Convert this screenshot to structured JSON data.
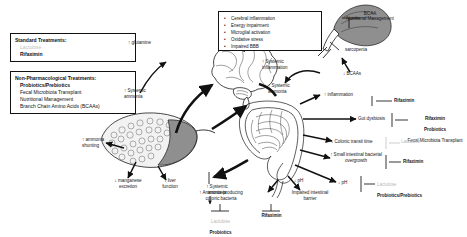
{
  "treatment_boxes": [
    {
      "id": "standard-treatments",
      "header": "Standard Treatments:",
      "items": [
        {
          "text": "Lactulose",
          "style": "grey"
        },
        {
          "text": "Rifaximin",
          "style": "bold"
        }
      ]
    },
    {
      "id": "non-pharmacological-treatments",
      "header": "Non-Pharmacological Treatments:",
      "items": [
        {
          "text": "Probiotics/Prebiotics",
          "style": "bold"
        },
        {
          "text": "Fecal Microbiota Transplant",
          "style": "plain"
        },
        {
          "text": "Nutritional Management",
          "style": "plain"
        },
        {
          "text": "Branch Chain Amino Acids (BCAAs)",
          "style": "plain"
        }
      ]
    }
  ],
  "symptom_box": {
    "items": [
      "Cerebral inflammation",
      "Energy impairment",
      "Microglial activation",
      "Oxidative stress",
      "Impaired BBB"
    ]
  },
  "labels": {
    "glutamine": "↑ glutamine",
    "systemic_ammonia_left": "↑ Systemic\nammonia",
    "systemic_inflammation": "↑ Systemic\ninflammation",
    "systemic_ammonia_mid": "↑ Systemic\nammonia",
    "bcaa_management": "BCAA\nNutritional Management",
    "sarcopenia": "sarcopenia",
    "bcaas_down": "↓ BCAAs",
    "inflammation_up": "↑ inflammation",
    "gut_dysbiosis": "Gut dysbiosis",
    "colonic_transit": "↓ Colonic transit time",
    "sibo": "↑ Small intestinal bacterial\novergrowth",
    "ph_right": "↓ pH",
    "ph_center": "↓ pH",
    "ammonia_producing": "↑ Ammonia-producing\ncolonic bacteria",
    "impaired_barrier": "Impaired intestinal\nbarrier",
    "ammonia_shunting": "↑ ammonia\nshunting",
    "manganese": "↓ manganese\nexcretion",
    "liver_function": "↓ liver\nfunction",
    "systemic_ammonia_liver": "↑ Systemic\nammonia"
  },
  "treatment_annotations": {
    "inflammation_rx": {
      "lines": [
        {
          "text": "Rifaximin",
          "style": "bold"
        }
      ]
    },
    "dysbiosis_rx": {
      "lines": [
        {
          "text": "Rifaximin",
          "style": "bold"
        },
        {
          "text": "Probiotics",
          "style": "bold"
        },
        {
          "text": "Fecal Microbiota Transplant",
          "style": "plain"
        }
      ]
    },
    "transit_rx": {
      "lines": [
        {
          "text": "Lactulose",
          "style": "grey"
        }
      ]
    },
    "sibo_rx": {
      "lines": [
        {
          "text": "Rifaximin",
          "style": "bold"
        }
      ]
    },
    "ph_rx": {
      "lines": [
        {
          "text": "Lactulose",
          "style": "grey"
        },
        {
          "text": "Probiotics/Prebiotics",
          "style": "bold"
        }
      ]
    },
    "bacteria_rx": {
      "lines": [
        {
          "text": "Lactulose",
          "style": "grey"
        },
        {
          "text": "Probiotics",
          "style": "bold"
        }
      ]
    },
    "barrier_rx": {
      "lines": [
        {
          "text": "Rifaximin",
          "style": "bold"
        }
      ]
    }
  },
  "organs": {
    "brain": "brain",
    "liver": "liver",
    "intestine": "intestine-colon",
    "muscle": "skeletal-muscle"
  },
  "colors": {
    "stroke": "#1a1a1a",
    "grey_text": "#b9b9b9",
    "muscle_fill": "#8f8f8f"
  }
}
